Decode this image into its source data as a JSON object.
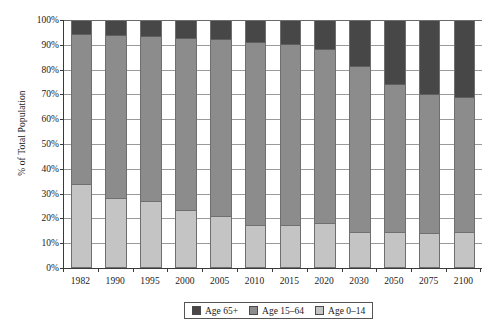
{
  "chart_data": {
    "type": "bar",
    "stacked": true,
    "stack_mode": "percent",
    "title": "",
    "subtitle": "",
    "xlabel": "",
    "ylabel": "% of Total Population",
    "categories": [
      "1982",
      "1990",
      "1995",
      "2000",
      "2005",
      "2010",
      "2015",
      "2020",
      "2030",
      "2050",
      "2075",
      "2100"
    ],
    "ylim": [
      0,
      100
    ],
    "ytick_labels": [
      "100%",
      "90%",
      "80%",
      "70%",
      "60%",
      "50%",
      "40%",
      "30%",
      "20%",
      "10%",
      "0%"
    ],
    "ytick_values": [
      100,
      90,
      80,
      70,
      60,
      50,
      40,
      30,
      20,
      10,
      0
    ],
    "grid": true,
    "legend_position": "bottom-center",
    "series": [
      {
        "name": "Age 65+",
        "color": "#474747",
        "values": [
          5.5,
          5.8,
          6.3,
          7.0,
          7.5,
          8.5,
          9.5,
          11.5,
          18.5,
          26.0,
          30.0,
          31.0
        ]
      },
      {
        "name": "Age 15–64",
        "color": "#8c8c8c",
        "values": [
          61.0,
          66.4,
          67.0,
          70.0,
          72.0,
          74.7,
          73.7,
          71.0,
          67.5,
          60.0,
          56.5,
          55.0
        ]
      },
      {
        "name": "Age 0–14",
        "color": "#c4c4c4",
        "values": [
          33.5,
          27.8,
          26.7,
          23.0,
          20.5,
          16.8,
          16.8,
          17.5,
          14.0,
          14.0,
          13.5,
          14.0
        ]
      }
    ]
  }
}
